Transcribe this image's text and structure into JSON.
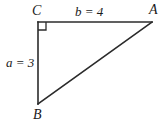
{
  "figure": {
    "type": "right-triangle-diagram",
    "background_color": "#ffffff",
    "stroke_color": "#2b2b2b",
    "labels": {
      "vertex_c": "C",
      "vertex_a": "A",
      "vertex_b": "B",
      "side_b": "b = 4",
      "side_a": "a = 3"
    },
    "right_angle_at": "C",
    "geometry": {
      "point_c": {
        "x": 38,
        "y": 22
      },
      "point_a": {
        "x": 152,
        "y": 22
      },
      "point_b": {
        "x": 38,
        "y": 104
      },
      "right_angle_marker_size": 8
    }
  }
}
